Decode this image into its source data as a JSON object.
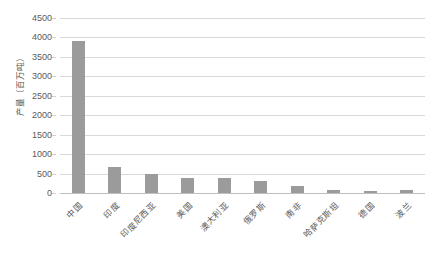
{
  "chart_data": {
    "type": "bar",
    "title": "",
    "xlabel": "",
    "ylabel": "产量（百万吨）",
    "ylim": [
      0,
      4500
    ],
    "ytick_step": 500,
    "yticks": [
      "4500",
      "4000",
      "3500",
      "3000",
      "2500",
      "2000",
      "1500",
      "1000",
      "500",
      "0"
    ],
    "grid": "horizontal",
    "legend": "none",
    "bar_color": "#9b9b9b",
    "gridline_color": "#d9d9d9",
    "text_color": "#5a5a5a",
    "categories": [
      "中国",
      "印度",
      "印度尼西亚",
      "美国",
      "澳大利亚",
      "俄罗斯",
      "南非",
      "哈萨克斯坦",
      "德国",
      "波兰"
    ],
    "values": [
      3900,
      680,
      490,
      390,
      390,
      300,
      180,
      80,
      60,
      70
    ],
    "series": [
      {
        "name": "产量",
        "values": [
          3900,
          680,
          490,
          390,
          390,
          300,
          180,
          80,
          60,
          70
        ]
      }
    ]
  }
}
